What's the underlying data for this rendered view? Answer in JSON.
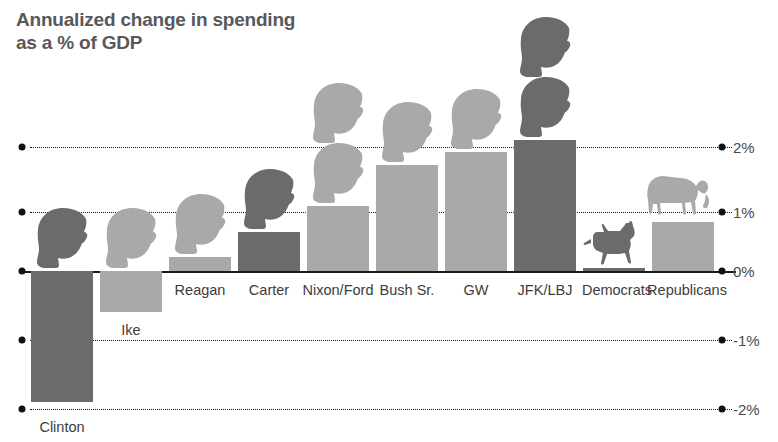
{
  "chart_data": {
    "type": "bar",
    "title": "Annualized change in spending\nas a % of GDP",
    "xlabel": "",
    "ylabel": "",
    "ylim": [
      -2.2,
      2.3
    ],
    "grid": true,
    "legend": "none",
    "unit": "%",
    "y_ticks": [
      {
        "label": "2%",
        "value": 2
      },
      {
        "label": "1%",
        "value": 1
      },
      {
        "label": "0%",
        "value": 0
      },
      {
        "label": "-1%",
        "value": -1
      },
      {
        "label": "-2%",
        "value": -2
      }
    ],
    "categories": [
      "Clinton",
      "Ike",
      "Reagan",
      "Carter",
      "Nixon/Ford",
      "Bush Sr.",
      "GW",
      "JFK/LBJ",
      "Democrats",
      "Republicans"
    ],
    "values": [
      -2.0,
      -0.63,
      0.22,
      0.6,
      1.0,
      1.62,
      1.82,
      2.0,
      0.05,
      0.75
    ],
    "parties": [
      "democrat",
      "republican",
      "republican",
      "democrat",
      "republican",
      "republican",
      "republican",
      "democrat",
      "democrat",
      "republican"
    ],
    "colors": {
      "democrat": "#6b6b6d",
      "republican": "#a9a9ab",
      "axis": "#1b1b1b",
      "title": "#58585a",
      "label": "#3c3c3e",
      "background": "#ffffff"
    },
    "marks": [
      {
        "category": "Clinton",
        "icon": "president-head-silhouette",
        "count": 1,
        "party": "democrat"
      },
      {
        "category": "Ike",
        "icon": "president-head-silhouette",
        "count": 1,
        "party": "republican"
      },
      {
        "category": "Reagan",
        "icon": "president-head-silhouette",
        "count": 1,
        "party": "republican"
      },
      {
        "category": "Carter",
        "icon": "president-head-silhouette",
        "count": 1,
        "party": "democrat"
      },
      {
        "category": "Nixon/Ford",
        "icon": "president-head-silhouette",
        "count": 2,
        "party": "republican"
      },
      {
        "category": "Bush Sr.",
        "icon": "president-head-silhouette",
        "count": 1,
        "party": "republican"
      },
      {
        "category": "GW",
        "icon": "president-head-silhouette",
        "count": 1,
        "party": "republican"
      },
      {
        "category": "JFK/LBJ",
        "icon": "president-head-silhouette",
        "count": 2,
        "party": "democrat"
      },
      {
        "category": "Democrats",
        "icon": "donkey-icon",
        "count": 1,
        "party": "democrat"
      },
      {
        "category": "Republicans",
        "icon": "elephant-icon",
        "count": 1,
        "party": "republican"
      }
    ]
  },
  "axis": {
    "tick_2": "2%",
    "tick_1": "1%",
    "tick_0": "0%",
    "tick_n1": "-1%",
    "tick_n2": "-2%"
  },
  "labels": {
    "c0": "Clinton",
    "c1": "Ike",
    "c2": "Reagan",
    "c3": "Carter",
    "c4": "Nixon/Ford",
    "c5": "Bush Sr.",
    "c6": "GW",
    "c7": "JFK/LBJ",
    "c8": "Democrats",
    "c9": "Republicans"
  },
  "title": {
    "text": "Annualized change in spending\nas a % of GDP"
  }
}
